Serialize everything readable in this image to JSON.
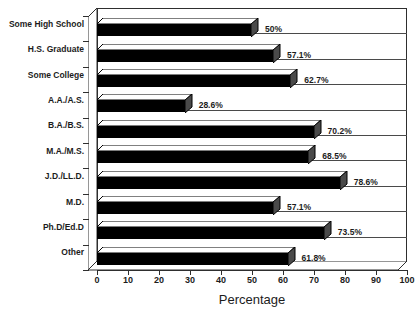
{
  "chart_data": {
    "type": "bar",
    "orientation": "horizontal",
    "title": "",
    "xlabel": "Percentage",
    "ylabel": "",
    "xlim": [
      0,
      100
    ],
    "xticks": [
      0,
      10,
      20,
      30,
      40,
      50,
      60,
      70,
      80,
      90,
      100
    ],
    "xtick_labels": [
      "0",
      "10",
      "20",
      "30",
      "40",
      "50",
      "60",
      "70",
      "80",
      "90",
      "100"
    ],
    "grid": false,
    "legend": null,
    "style": "3d-horizontal-bar",
    "bar_color": "#000000",
    "categories": [
      "Some High School",
      "H.S. Graduate",
      "Some College",
      "A.A./A.S.",
      "B.A./B.S.",
      "M.A./M.S.",
      "J.D./LL.D.",
      "M.D.",
      "Ph.D/Ed.D",
      "Other"
    ],
    "values": [
      50,
      57.1,
      62.7,
      28.6,
      70.2,
      68.5,
      78.6,
      57.1,
      73.5,
      61.8
    ],
    "data_labels": [
      "50%",
      "57.1%",
      "62.7%",
      "28.6%",
      "70.2%",
      "68.5%",
      "78.6%",
      "57.1%",
      "73.5%",
      "61.8%"
    ]
  },
  "axis": {
    "x_title": "Percentage"
  }
}
